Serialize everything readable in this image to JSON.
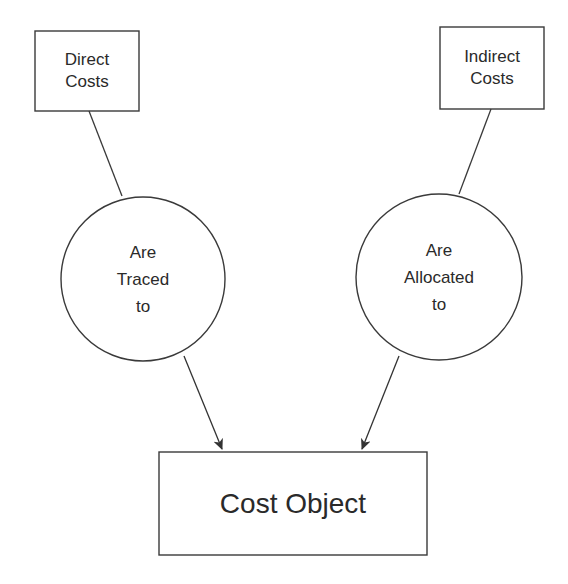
{
  "diagram": {
    "type": "flow",
    "colors": {
      "stroke": "#3a3a3a",
      "text": "#2a2a2a",
      "background": "#ffffff"
    },
    "nodes": {
      "direct_costs": {
        "shape": "rectangle",
        "lines": [
          "Direct",
          "Costs"
        ]
      },
      "indirect_costs": {
        "shape": "rectangle",
        "lines": [
          "Indirect",
          "Costs"
        ]
      },
      "traced": {
        "shape": "circle",
        "lines": [
          "Are",
          "Traced",
          "to"
        ]
      },
      "allocated": {
        "shape": "circle",
        "lines": [
          "Are",
          "Allocated",
          "to"
        ]
      },
      "cost_object": {
        "shape": "rectangle",
        "label": "Cost Object"
      }
    },
    "edges": [
      {
        "from": "direct_costs",
        "to": "traced",
        "arrow": false
      },
      {
        "from": "traced",
        "to": "cost_object",
        "arrow": true
      },
      {
        "from": "indirect_costs",
        "to": "allocated",
        "arrow": false
      },
      {
        "from": "allocated",
        "to": "cost_object",
        "arrow": true
      }
    ]
  }
}
